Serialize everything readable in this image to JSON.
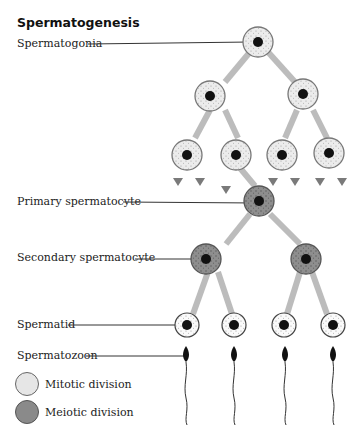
{
  "title": "Spermatogenesis",
  "stages": [
    {
      "label": "Spermatogonia"
    },
    {
      "label": "Primary spermatocyte"
    },
    {
      "label": "Secondary spermatocyte"
    },
    {
      "label": "Spermatid"
    },
    {
      "label": "Spermatozoon"
    }
  ],
  "legend": {
    "mitotic": {
      "label": "Mitotic division",
      "color": "#e6e6e6"
    },
    "meiotic": {
      "label": "Meiotic division",
      "color": "#8a8a8a"
    }
  },
  "colors": {
    "mitotic_cell": "#e9e9e9",
    "meiotic_cell": "#8e8e8e",
    "nucleus": "#111111",
    "arrow": "#9a9a9a",
    "leader_line": "#333333"
  }
}
